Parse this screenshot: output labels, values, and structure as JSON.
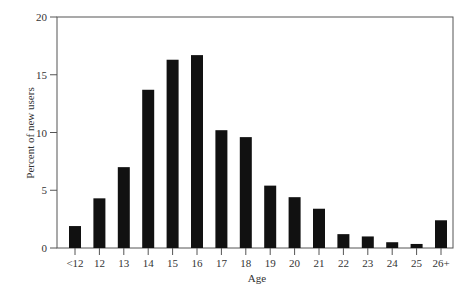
{
  "chart_data": {
    "type": "bar",
    "title": "",
    "xlabel": "Age",
    "ylabel": "Percent of new users",
    "categories": [
      "<12",
      "12",
      "13",
      "14",
      "15",
      "16",
      "17",
      "18",
      "19",
      "20",
      "21",
      "22",
      "23",
      "24",
      "25",
      "26+"
    ],
    "values": [
      1.9,
      4.3,
      7.0,
      13.7,
      16.3,
      16.7,
      10.2,
      9.6,
      5.4,
      4.4,
      3.4,
      1.2,
      1.0,
      0.5,
      0.35,
      2.4
    ],
    "ylim": [
      0,
      20
    ],
    "yticks": [
      0,
      5,
      10,
      15,
      20
    ],
    "grid": false,
    "legend": null,
    "bar_color": "#111111"
  }
}
